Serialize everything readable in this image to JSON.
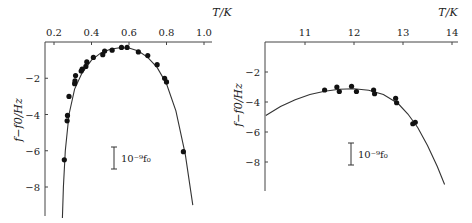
{
  "chart_data": [
    {
      "type": "scatter",
      "title": "",
      "xlabel": "T/K",
      "ylabel": "f−f0/Hz",
      "x_ticks": [
        "0.2",
        "0.4",
        "0.6",
        "0.8",
        "1.0"
      ],
      "y_ticks": [
        "-2",
        "-4",
        "-6",
        "-8"
      ],
      "xlim": [
        0.15,
        1.05
      ],
      "ylim": [
        -10,
        0
      ],
      "x_axis_position": "top",
      "grid": false,
      "scale_bar_label": "10⁻⁹f₀",
      "points": [
        {
          "x": 0.255,
          "y": -6.5
        },
        {
          "x": 0.27,
          "y": -4.35
        },
        {
          "x": 0.272,
          "y": -4.05
        },
        {
          "x": 0.28,
          "y": -3.0
        },
        {
          "x": 0.31,
          "y": -2.3
        },
        {
          "x": 0.312,
          "y": -2.15
        },
        {
          "x": 0.315,
          "y": -1.85
        },
        {
          "x": 0.345,
          "y": -1.6
        },
        {
          "x": 0.35,
          "y": -1.5
        },
        {
          "x": 0.37,
          "y": -1.35
        },
        {
          "x": 0.375,
          "y": -1.1
        },
        {
          "x": 0.41,
          "y": -0.85
        },
        {
          "x": 0.46,
          "y": -0.7
        },
        {
          "x": 0.47,
          "y": -0.5
        },
        {
          "x": 0.51,
          "y": -0.45
        },
        {
          "x": 0.56,
          "y": -0.3
        },
        {
          "x": 0.59,
          "y": -0.3
        },
        {
          "x": 0.65,
          "y": -0.55
        },
        {
          "x": 0.7,
          "y": -0.75
        },
        {
          "x": 0.75,
          "y": -1.25
        },
        {
          "x": 0.79,
          "y": -2.0
        },
        {
          "x": 0.8,
          "y": -2.2
        },
        {
          "x": 0.89,
          "y": -6.05
        }
      ],
      "fit_curve": [
        [
          0.245,
          -10.0
        ],
        [
          0.25,
          -8.0
        ],
        [
          0.26,
          -6.0
        ],
        [
          0.28,
          -4.0
        ],
        [
          0.31,
          -2.6
        ],
        [
          0.35,
          -1.7
        ],
        [
          0.4,
          -1.0
        ],
        [
          0.45,
          -0.6
        ],
        [
          0.5,
          -0.4
        ],
        [
          0.55,
          -0.32
        ],
        [
          0.6,
          -0.33
        ],
        [
          0.65,
          -0.5
        ],
        [
          0.7,
          -0.85
        ],
        [
          0.75,
          -1.4
        ],
        [
          0.8,
          -2.3
        ],
        [
          0.85,
          -3.8
        ],
        [
          0.9,
          -6.2
        ],
        [
          0.94,
          -9.0
        ]
      ]
    },
    {
      "type": "scatter",
      "title": "",
      "xlabel": "T/K",
      "ylabel": "f−f0/Hz",
      "x_ticks": [
        "11",
        "12",
        "13",
        "14"
      ],
      "y_ticks": [
        "-2",
        "-4",
        "-6",
        "-8"
      ],
      "xlim": [
        10.2,
        14.1
      ],
      "ylim": [
        -10,
        0
      ],
      "x_axis_position": "top",
      "grid": false,
      "scale_bar_label": "10⁻⁹f₀",
      "points": [
        {
          "x": 11.4,
          "y": -3.2
        },
        {
          "x": 11.65,
          "y": -3.0
        },
        {
          "x": 11.7,
          "y": -3.3
        },
        {
          "x": 11.95,
          "y": -2.95
        },
        {
          "x": 12.05,
          "y": -3.3
        },
        {
          "x": 12.4,
          "y": -3.2
        },
        {
          "x": 12.42,
          "y": -3.45
        },
        {
          "x": 12.85,
          "y": -3.75
        },
        {
          "x": 12.87,
          "y": -4.05
        },
        {
          "x": 13.2,
          "y": -5.45
        },
        {
          "x": 13.25,
          "y": -5.35
        }
      ],
      "fit_curve": [
        [
          10.2,
          -4.9
        ],
        [
          10.5,
          -4.3
        ],
        [
          10.8,
          -3.85
        ],
        [
          11.1,
          -3.5
        ],
        [
          11.4,
          -3.28
        ],
        [
          11.7,
          -3.15
        ],
        [
          12.0,
          -3.12
        ],
        [
          12.3,
          -3.22
        ],
        [
          12.6,
          -3.5
        ],
        [
          12.9,
          -4.1
        ],
        [
          13.1,
          -4.8
        ],
        [
          13.3,
          -5.7
        ],
        [
          13.5,
          -6.9
        ],
        [
          13.7,
          -8.3
        ],
        [
          13.85,
          -9.5
        ]
      ]
    }
  ]
}
